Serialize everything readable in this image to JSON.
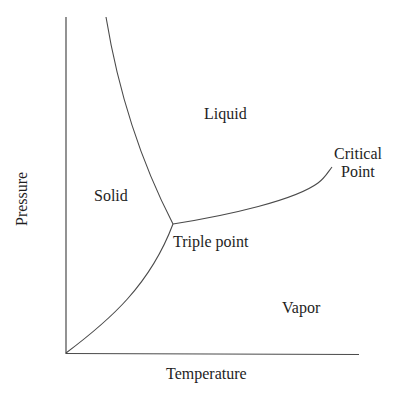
{
  "diagram": {
    "type": "phase-diagram",
    "axes": {
      "x_label": "Temperature",
      "y_label": "Pressure"
    },
    "regions": {
      "solid": "Solid",
      "liquid": "Liquid",
      "vapor": "Vapor"
    },
    "points": {
      "triple_point": "Triple point",
      "critical_point_line1": "Critical",
      "critical_point_line2": "Point"
    },
    "colors": {
      "line": "#4a4a4a",
      "text": "#1e1e1e",
      "background": "#ffffff"
    }
  }
}
